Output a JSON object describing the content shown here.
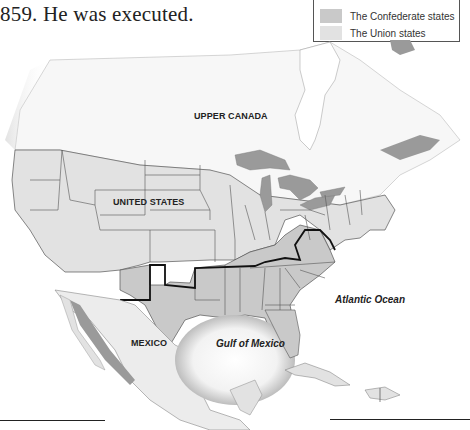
{
  "caption": "859. He was executed.",
  "legend": {
    "items": [
      {
        "label": "The Confederate states",
        "color": "#c9c9c9"
      },
      {
        "label": "The Union states",
        "color": "#e2e2e2"
      }
    ]
  },
  "map": {
    "regions": {
      "canada": "UPPER CANADA",
      "us": "UNITED STATES",
      "mexico": "MEXICO"
    },
    "water": {
      "gulf": "Gulf of Mexico",
      "atlantic": "Atlantic Ocean"
    },
    "colors": {
      "canada": "#f7f7f7",
      "union": "#e2e2e2",
      "confederate": "#c9c9c9",
      "lakes": "#9a9a9a",
      "mexico": "#ececec",
      "boundary": "#111111",
      "state_line": "#555555"
    }
  }
}
